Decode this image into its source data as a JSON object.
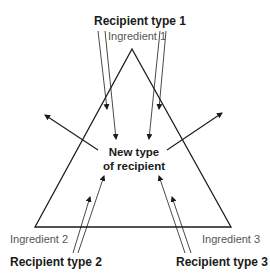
{
  "diagram": {
    "type": "ternary-triangle",
    "center_label": [
      "New type",
      "of recipient"
    ],
    "vertices": [
      {
        "ingredient": "Ingredient 1",
        "recipient": "Recipient type 1",
        "position": "top"
      },
      {
        "ingredient": "Ingredient 2",
        "recipient": "Recipient type 2",
        "position": "bottom-left"
      },
      {
        "ingredient": "Ingredient 3",
        "recipient": "Recipient type 3",
        "position": "bottom-right"
      }
    ],
    "colors": {
      "line": "#1a1a1a",
      "ingredient_text": "#555555",
      "bold_text": "#1a1a1a"
    }
  }
}
